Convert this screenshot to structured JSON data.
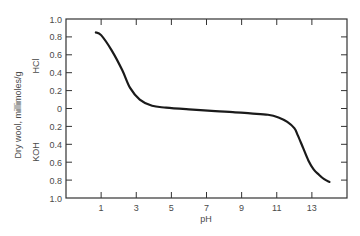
{
  "chart_data": {
    "type": "line",
    "title": "",
    "xlabel": "pH",
    "ylabel": "Dry wool, millimoles/g",
    "ylabel_upper": "HCl",
    "ylabel_lower": "KOH",
    "xlim": [
      -1,
      15
    ],
    "ylim": [
      -1.0,
      1.0
    ],
    "x_ticks": [
      1,
      3,
      5,
      7,
      9,
      11,
      13
    ],
    "y_ticks": [
      1.0,
      0.8,
      0.6,
      0.4,
      0.2,
      0,
      -0.2,
      -0.4,
      -0.6,
      -0.8,
      -1.0
    ],
    "y_tick_labels": [
      "1.0",
      "0.8",
      "0.6",
      "0.4",
      "0.2",
      "0",
      "0.2",
      "0.4",
      "0.6",
      "0.8",
      "1.0"
    ],
    "grid": false,
    "legend": null,
    "series": [
      {
        "name": "Acid/base binding of wool",
        "x": [
          0.7,
          1.0,
          1.6,
          2.2,
          2.65,
          3.2,
          3.9,
          4.7,
          6.0,
          7.5,
          8.5,
          9.5,
          10.5,
          11.1,
          11.6,
          12.0,
          12.2,
          12.5,
          12.8,
          13.1,
          13.4,
          13.7,
          14.0
        ],
        "y": [
          0.85,
          0.82,
          0.65,
          0.43,
          0.23,
          0.1,
          0.03,
          0.01,
          -0.01,
          -0.03,
          -0.04,
          -0.055,
          -0.07,
          -0.1,
          -0.15,
          -0.22,
          -0.3,
          -0.44,
          -0.58,
          -0.68,
          -0.74,
          -0.79,
          -0.82
        ]
      }
    ]
  }
}
